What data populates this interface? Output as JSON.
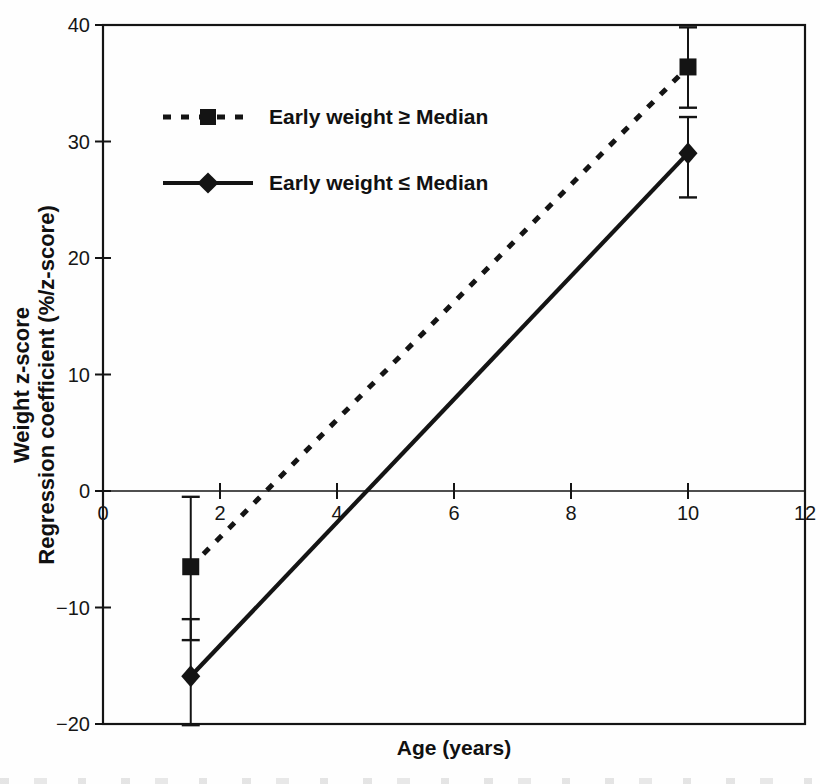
{
  "figure": {
    "xlabel": "Age (years)",
    "ylabel_line1": "Weight z-score",
    "ylabel_line2": "Regression coefficient (%/z-score)",
    "legend": [
      {
        "label": "Early weight ≥ Median",
        "marker": "square",
        "line": "dashed"
      },
      {
        "label": "Early weight ≤ Median",
        "marker": "diamond",
        "line": "solid"
      }
    ],
    "colors": {
      "ink": "#141414",
      "background": "#fefefe"
    }
  },
  "chart_data": {
    "type": "line",
    "title": "",
    "xlabel": "Age (years)",
    "ylabel": "Weight z-score Regression coefficient (%/z-score)",
    "xlim": [
      0,
      12
    ],
    "ylim": [
      -20,
      40
    ],
    "x_ticks": [
      0,
      2,
      4,
      6,
      8,
      10,
      12
    ],
    "y_ticks": [
      40,
      30,
      20,
      10,
      0,
      -10,
      -20
    ],
    "grid": false,
    "legend_position": "upper-left-inside",
    "series": [
      {
        "name": "Early weight ≥ Median",
        "marker": "square",
        "line_style": "dashed",
        "x": [
          1.5,
          10
        ],
        "y": [
          -6.5,
          36.4
        ],
        "error_low": [
          -12.8,
          32.9
        ],
        "error_high": [
          -0.5,
          39.8
        ]
      },
      {
        "name": "Early weight ≤ Median",
        "marker": "diamond",
        "line_style": "solid",
        "x": [
          1.5,
          10
        ],
        "y": [
          -15.9,
          29.0
        ],
        "error_low": [
          -20.1,
          25.2
        ],
        "error_high": [
          -11.0,
          32.1
        ]
      }
    ]
  }
}
